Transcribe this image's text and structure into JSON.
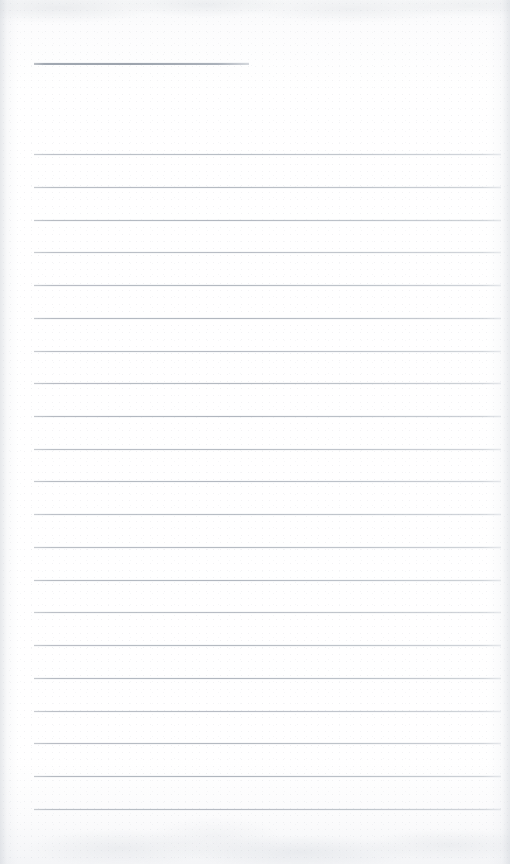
{
  "document": {
    "kind": "scanned-blank-ruled-notepad-page",
    "page_width": 510,
    "page_height": 864,
    "page_color": "#fdfdfd",
    "rule_color": "#b0b5bd",
    "heading_rule_color": "#9aa1ab",
    "content_text": "",
    "visible_text_items": []
  },
  "heading_rule": {
    "label": "heading-rule",
    "x": 34,
    "y": 63,
    "width": 215,
    "thickness": 1.6
  },
  "rules": {
    "label": "ruled-lines",
    "count": 21,
    "x_start": 34,
    "x_end": 501,
    "first_y": 154,
    "spacing": 32.9,
    "y_positions": [
      154,
      187,
      220,
      252,
      285,
      318,
      351,
      383,
      416,
      449,
      481,
      514,
      547,
      580,
      612,
      645,
      678,
      711,
      743,
      776,
      809
    ]
  },
  "texture": {
    "top_band_label": "scan-shadow-top",
    "bottom_band_label": "scan-shadow-bottom",
    "left_edge_label": "scan-edge-left",
    "right_edge_label": "scan-edge-right"
  }
}
